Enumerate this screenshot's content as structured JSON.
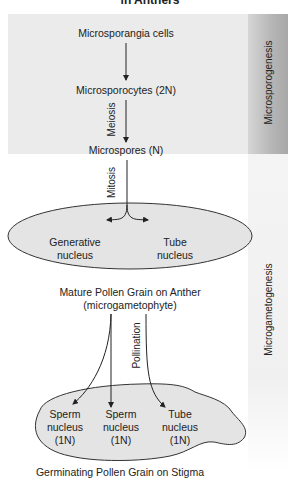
{
  "title": "in Anthers",
  "stages": {
    "top_band": "Microsporogenesis",
    "bottom_band": "Microgametogenesis"
  },
  "nodes": {
    "microsporangia": "Microsporangia cells",
    "microsporocytes": "Microsporocytes (2N)",
    "microspores": "Microspores (N)",
    "generative_l1": "Generative",
    "generative_l2": "nucleus",
    "tube_l1": "Tube",
    "tube_l2": "nucleus",
    "mature_l1": "Mature Pollen Grain on Anther",
    "mature_l2": "(microgametophyte)",
    "sperm1_l1": "Sperm",
    "sperm1_l2": "nucleus",
    "sperm1_l3": "(1N)",
    "sperm2_l1": "Sperm",
    "sperm2_l2": "nucleus",
    "sperm2_l3": "(1N)",
    "tube2_l1": "Tube",
    "tube2_l2": "nucleus",
    "tube2_l3": "(1N)",
    "germinating": "Germinating Pollen Grain on Stigma"
  },
  "edges": {
    "meiosis": "Meiosis",
    "mitosis": "Mitosis",
    "pollination": "Pollination"
  },
  "colors": {
    "panel_gray": "#ebebeb",
    "shape_fill": "#e4e4e4",
    "band_dark": "#a8a8a8",
    "line": "#222222"
  }
}
